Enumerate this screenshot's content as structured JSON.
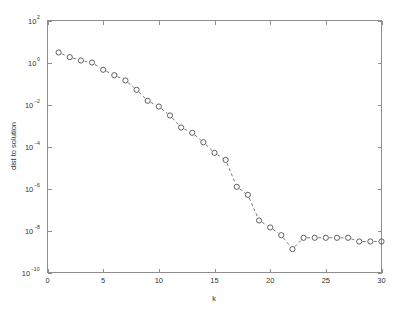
{
  "chart_data": {
    "type": "line",
    "title": "",
    "xlabel": "k",
    "ylabel": "dist to solution",
    "xlim": [
      0,
      30
    ],
    "ylim": [
      1e-10,
      100
    ],
    "yscale": "log",
    "xscale": "linear",
    "grid": false,
    "legend": null,
    "x_ticks": [
      0,
      5,
      10,
      15,
      20,
      25,
      30
    ],
    "x_tick_labels": [
      "0",
      "5",
      "10",
      "15",
      "20",
      "25",
      "30"
    ],
    "y_ticks": [
      100,
      1,
      0.01,
      0.0001,
      1e-06,
      1e-08,
      1e-10
    ],
    "y_tick_labels": [
      "10^2",
      "10^0",
      "10^-2",
      "10^-4",
      "10^-6",
      "10^-8",
      "10^-10"
    ],
    "y_tick_mantissa": [
      "10",
      "10",
      "10",
      "10",
      "10",
      "10",
      "10"
    ],
    "y_tick_exponents": [
      "2",
      "0",
      "-2",
      "-4",
      "-6",
      "-8",
      "-10"
    ],
    "marker": "circle",
    "linestyle": "dashed",
    "x": [
      1,
      2,
      3,
      4,
      5,
      6,
      7,
      8,
      9,
      10,
      11,
      12,
      13,
      14,
      15,
      16,
      17,
      18,
      19,
      20,
      21,
      22,
      23,
      24,
      25,
      26,
      27,
      28,
      29,
      30
    ],
    "y": [
      3.0,
      1.8,
      1.25,
      1.0,
      0.45,
      0.25,
      0.14,
      0.05,
      0.015,
      0.008,
      0.003,
      0.0008,
      0.00045,
      0.00016,
      5e-05,
      2.3e-05,
      1.2e-06,
      5e-07,
      3e-08,
      1.4e-08,
      6e-09,
      1.3e-09,
      4.5e-09,
      4.5e-09,
      4.5e-09,
      4.5e-09,
      4.5e-09,
      3e-09,
      3e-09,
      3e-09
    ]
  },
  "colors": {
    "axis": "#8d8d8d",
    "text": "#333333",
    "line": "#555555",
    "marker": "#444444",
    "background": "#ffffff"
  }
}
